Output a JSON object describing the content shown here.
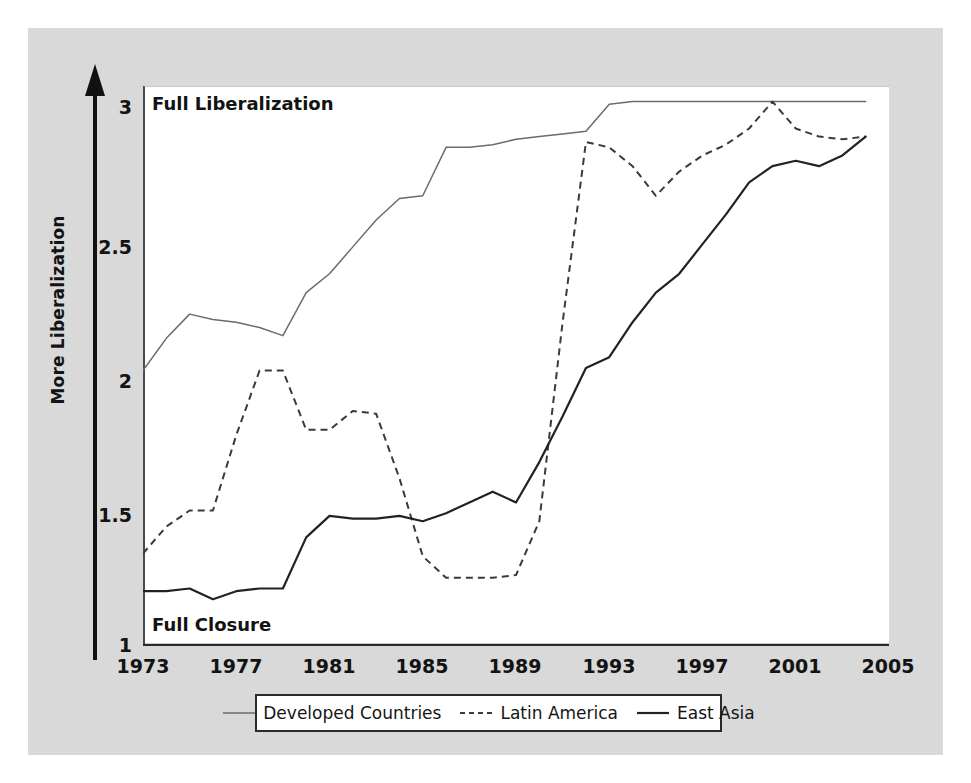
{
  "figure": {
    "background_color": "#d9d9d9",
    "plot_background": "#ffffff",
    "axis_arrow_label": "More Liberalization",
    "top_annotation": "Full Liberalization",
    "bottom_annotation": "Full Closure"
  },
  "legend": {
    "entries": [
      {
        "label": "Developed Countries",
        "style": "solid",
        "color": "#6b6b6b",
        "width": 1.4
      },
      {
        "label": "Latin America",
        "style": "dashed",
        "color": "#3a3a3a",
        "width": 1.8
      },
      {
        "label": "East Asia",
        "style": "solid",
        "color": "#222222",
        "width": 2.2
      }
    ]
  },
  "chart_data": {
    "type": "line",
    "title": "",
    "subtitle": "",
    "xlabel": "",
    "ylabel": "More Liberalization",
    "xlim": [
      1973,
      2005
    ],
    "ylim": [
      1,
      3
    ],
    "grid": false,
    "legend_position": "below-axes",
    "y_ticks": [
      1,
      1.5,
      2,
      2.5,
      3
    ],
    "y_tick_labels": [
      "1",
      "1.5",
      "2",
      "2.5",
      "3"
    ],
    "x_ticks": [
      1973,
      1977,
      1981,
      1985,
      1989,
      1993,
      1997,
      2001,
      2005
    ],
    "x_tick_labels": [
      "1973",
      "1977",
      "1981",
      "1985",
      "1989",
      "1993",
      "1997",
      "2001",
      "2005"
    ],
    "x_minor_tick_interval": 1,
    "annotations": [
      {
        "text": "Full Liberalization",
        "x": 1973.5,
        "y": 3.0,
        "position": "top-left-inside"
      },
      {
        "text": "Full Closure",
        "x": 1973.5,
        "y": 1.07,
        "position": "bottom-left-inside"
      }
    ],
    "x": [
      1973,
      1974,
      1975,
      1976,
      1977,
      1978,
      1979,
      1980,
      1981,
      1982,
      1983,
      1984,
      1985,
      1986,
      1987,
      1988,
      1989,
      1990,
      1991,
      1992,
      1993,
      1994,
      1995,
      1996,
      1997,
      1998,
      1999,
      2000,
      2001,
      2002,
      2003,
      2004
    ],
    "series": [
      {
        "name": "Developed Countries",
        "style": "solid",
        "values": [
          2.02,
          2.14,
          2.23,
          2.21,
          2.2,
          2.18,
          2.15,
          2.31,
          2.38,
          2.48,
          2.58,
          2.66,
          2.67,
          2.85,
          2.85,
          2.86,
          2.88,
          2.89,
          2.9,
          2.91,
          3.01,
          3.02,
          3.02,
          3.02,
          3.02,
          3.02,
          3.02,
          3.02,
          3.02,
          3.02,
          3.02,
          3.02
        ]
      },
      {
        "name": "Latin America",
        "style": "dashed",
        "values": [
          1.34,
          1.44,
          1.5,
          1.5,
          1.78,
          2.02,
          2.02,
          1.8,
          1.8,
          1.87,
          1.86,
          1.62,
          1.33,
          1.25,
          1.25,
          1.25,
          1.26,
          1.46,
          2.2,
          2.87,
          2.85,
          2.78,
          2.67,
          2.76,
          2.82,
          2.86,
          2.92,
          3.02,
          2.92,
          2.89,
          2.88,
          2.89
        ]
      },
      {
        "name": "East Asia",
        "style": "solid",
        "values": [
          1.2,
          1.2,
          1.21,
          1.17,
          1.2,
          1.21,
          1.21,
          1.4,
          1.48,
          1.47,
          1.47,
          1.48,
          1.46,
          1.49,
          1.53,
          1.57,
          1.53,
          1.68,
          1.85,
          2.03,
          2.07,
          2.2,
          2.31,
          2.38,
          2.49,
          2.6,
          2.72,
          2.78,
          2.8,
          2.78,
          2.82,
          2.89
        ]
      }
    ]
  }
}
